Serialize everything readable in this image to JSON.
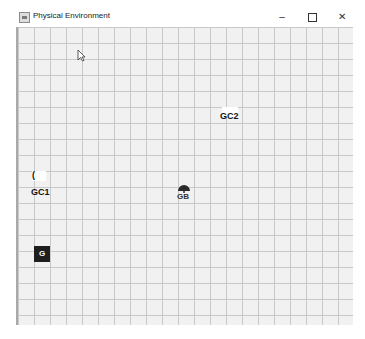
{
  "window": {
    "title": "Physical Environment",
    "controls": {
      "minimize": "–",
      "maximize": "",
      "close": "✕"
    }
  },
  "canvas": {
    "grid_cell_px": 16,
    "background": "#f1f1f1",
    "grid_color": "#c9c9c9",
    "entities": [
      {
        "id": "gc2",
        "label": "GC2"
      },
      {
        "id": "gc1",
        "label": "GC1",
        "glyph": "("
      },
      {
        "id": "gb",
        "label": "GB"
      },
      {
        "id": "g",
        "label": "G"
      }
    ]
  }
}
